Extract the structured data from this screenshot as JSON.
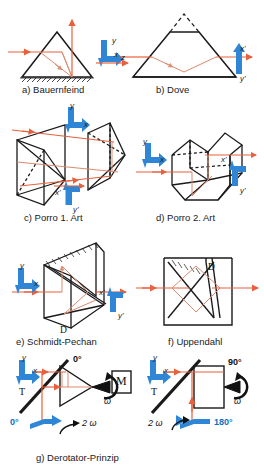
{
  "figure": {
    "colors": {
      "ray": "#e8603c",
      "ray_light": "#e09b84",
      "outline": "#1a1a1a",
      "marker_blue": "#2f86d6",
      "marker_blue_dark": "#0d6fc4",
      "background": "#ffffff"
    }
  },
  "panels": [
    {
      "id": "a",
      "caption": "a) Bauernfeind",
      "axis_labels": {
        "y": "y",
        "x": "x",
        "z": "z"
      }
    },
    {
      "id": "b",
      "caption": "b) Dove",
      "axis_labels": {
        "x_out": "x'",
        "y_out": "y'"
      }
    },
    {
      "id": "c",
      "caption": "c) Porro 1. Art",
      "axis_labels": {
        "y": "y",
        "x": "x",
        "x_out": "x'",
        "y_out": "y'"
      }
    },
    {
      "id": "d",
      "caption": "d) Porro 2. Art",
      "axis_labels": {
        "y": "y",
        "x": "x",
        "x_out": "x'",
        "y_out": "y'"
      }
    },
    {
      "id": "e",
      "caption": "e) Schmidt-Pechan",
      "axis_labels": {
        "y": "y",
        "x": "x",
        "x_out": "x'",
        "y_out": "y'"
      },
      "part_label": "D"
    },
    {
      "id": "f",
      "caption": "f) Uppendahl",
      "part_label": "D"
    },
    {
      "id": "g",
      "caption": "g) Derotator-Prinzip",
      "left": {
        "axis_labels": {
          "y": "y",
          "x": "x"
        },
        "target_label": "T",
        "mirror_label": "M",
        "angle_top": "0°",
        "angle_bottom": "0°",
        "omega": "ω",
        "rotation": "2 ω"
      },
      "right": {
        "axis_labels": {
          "y": "y",
          "x": "x"
        },
        "target_label": "T",
        "angle_top": "90°",
        "angle_bottom": "180°",
        "omega": "ω",
        "rotation": "2 ω"
      }
    }
  ]
}
